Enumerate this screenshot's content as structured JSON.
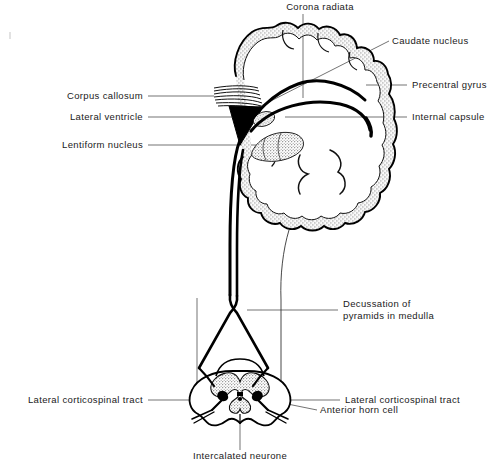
{
  "figure": {
    "type": "anatomical-line-diagram",
    "background_color": "#ffffff",
    "ink_color": "#000000",
    "stipple_color": "#8a8a8a",
    "leader_color": "#555555"
  },
  "labels": {
    "corona_radiata": "Corona radiata",
    "caudate_nucleus": "Caudate nucleus",
    "precentral_gyrus": "Precentral gyrus",
    "internal_capsule": "Internal capsule",
    "corpus_callosum": "Corpus callosum",
    "lateral_ventricle": "Lateral ventricle",
    "lentiform_nucleus": "Lentiform nucleus",
    "decussation_line1": "Decussation of",
    "decussation_line2": "pyramids in medulla",
    "lateral_corticospinal_tract_left": "Lateral corticospinal tract",
    "lateral_corticospinal_tract_right": "Lateral corticospinal tract",
    "anterior_horn_cell": "Anterior horn cell",
    "intercalated_neurone": "Intercalated neurone"
  },
  "structures": {
    "cerebral_hemisphere": "coronal section of cerebral hemisphere with stippled cortex",
    "corpus_callosum_band": "horizontally hatched band",
    "lateral_ventricle_shape": "solid black triangle",
    "lentiform_nucleus_shape": "stippled lens-shaped nucleus",
    "caudate_nucleus_shape": "stippled nucleus",
    "internal_capsule_shape": "thick black arc",
    "brainstem": "descending tract",
    "medulla_decussation": "crossing X of pyramidal fibres",
    "spinal_cord": "transverse section with butterfly grey matter",
    "anterior_horn_cell_shape": "solid black motor neurone in anterior horn",
    "intercalated_neurone_shape": "small central neurone"
  }
}
